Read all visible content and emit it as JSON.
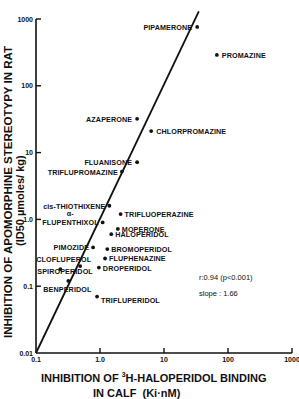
{
  "chart_data": {
    "type": "scatter",
    "title": "",
    "xlabel": "INHIBITION OF 3H-HALOPERIDOL BINDING IN CALF (Ki·nM)",
    "xlabel_line1_pre": "INHIBITION OF ",
    "xlabel_line1_sup": "3",
    "xlabel_line1_post": "H-HALOPERIDOL BINDING",
    "xlabel_line2": "IN CALF  (Ki·nM)",
    "ylabel": "INHIBITION OF APOMORPHINE STEREOTYPY IN RAT (ID50 µmoles/kg)",
    "ylabel_line1": "INHIBITION OF APOMORPHINE STEREOTYPY IN RAT",
    "ylabel_line2": "(ID50 µmoles/ kg)",
    "xscale": "log",
    "yscale": "log",
    "xlim": [
      0.1,
      1000
    ],
    "ylim": [
      0.01,
      1000
    ],
    "x_ticks": [
      "0.1",
      "1.0",
      "10",
      "100",
      "1000"
    ],
    "y_ticks": [
      "0.01",
      "0.1",
      "1.0",
      "10",
      "100",
      "1000"
    ],
    "grid": false,
    "points": [
      {
        "name": "PIPAMERONE",
        "x": 33,
        "y": 760
      },
      {
        "name": "PROMAZINE",
        "x": 67,
        "y": 290
      },
      {
        "name": "AZAPERONE",
        "x": 3.8,
        "y": 32
      },
      {
        "name": "CHLORPROMAZINE",
        "x": 6.3,
        "y": 21
      },
      {
        "name": "FLUANISONE",
        "x": 3.8,
        "y": 7.2
      },
      {
        "name": "TRIFLUPROMAZINE",
        "x": 2.2,
        "y": 5.2
      },
      {
        "name": "cis-THIOTHIXENE",
        "x": 1.4,
        "y": 1.6
      },
      {
        "name": "α-FLUPENTHIXOL",
        "x": 1.1,
        "y": 0.9
      },
      {
        "name": "TRIFLUOPERAZINE",
        "x": 2.1,
        "y": 1.2
      },
      {
        "name": "MOPERONE",
        "x": 1.9,
        "y": 0.72
      },
      {
        "name": "HALOPERIDOL",
        "x": 1.5,
        "y": 0.6
      },
      {
        "name": "PIMOZIDE",
        "x": 0.78,
        "y": 0.38
      },
      {
        "name": "BROMOPERIDOL",
        "x": 1.3,
        "y": 0.36
      },
      {
        "name": "FLUPHENAZINE",
        "x": 1.2,
        "y": 0.26
      },
      {
        "name": "CLOFLUPEROL",
        "x": 0.49,
        "y": 0.2
      },
      {
        "name": "DROPERIDOL",
        "x": 0.96,
        "y": 0.19
      },
      {
        "name": "SPIROPERIDOL",
        "x": 0.24,
        "y": 0.18
      },
      {
        "name": "BENPERIDOL",
        "x": 0.32,
        "y": 0.12
      },
      {
        "name": "TRIFLUPERIDOL",
        "x": 0.9,
        "y": 0.07
      }
    ],
    "regression_line": {
      "x_start": 0.1,
      "y_start": 0.01,
      "x_end": 35,
      "y_end": 1300
    },
    "annotations": {
      "correlation": "r:0.94 (p<0.001)",
      "slope": "slope : 1.66"
    },
    "legend": null
  }
}
